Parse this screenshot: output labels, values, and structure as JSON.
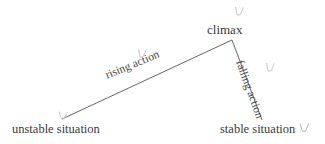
{
  "diagram": {
    "background_color": "#ffffff",
    "line_color": "#555555",
    "text_color": "#3a3a3a",
    "labels": {
      "climax": "climax",
      "rising_action": "rising action",
      "falling_action": "falling action",
      "unstable_situation": "unstable situation",
      "stable_situation": "stable situation"
    },
    "geometry": {
      "start_point": [
        62,
        119
      ],
      "apex_point": [
        232,
        40
      ],
      "end_point": [
        262,
        120
      ]
    },
    "artifacts": {
      "cursor_glyph": "cursor-arc-mark",
      "count": 5
    }
  }
}
